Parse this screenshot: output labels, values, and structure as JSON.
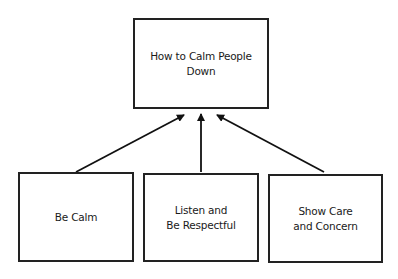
{
  "diagram": {
    "root": {
      "label": "How to Calm People Down"
    },
    "children": [
      {
        "label": "Be Calm"
      },
      {
        "label": "Listen and\nBe Respectful"
      },
      {
        "label": "Show Care\nand Concern"
      }
    ]
  }
}
